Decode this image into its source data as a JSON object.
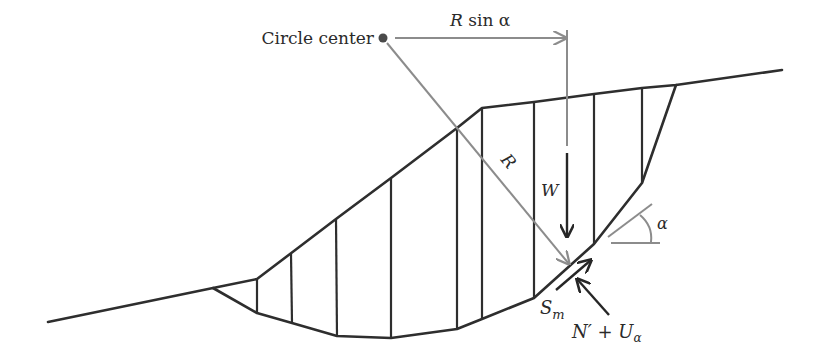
{
  "figure": {
    "labels": {
      "circle_center": "Circle center",
      "r_sin_alpha_R": "R",
      "r_sin_alpha_rest": " sin α",
      "radius": "R",
      "weight": "W",
      "alpha": "α",
      "shear_S": "S",
      "shear_sub": "m",
      "normal_N": "N′ + U",
      "normal_sub": "α"
    },
    "colors": {
      "line": "#2e2e2e",
      "construction": "#8c8c8c",
      "background": "#ffffff"
    },
    "geometry": {
      "circle_center": [
        383,
        38
      ],
      "ground_surface": [
        [
          48,
          322
        ],
        [
          213,
          288
        ],
        [
          257,
          279
        ],
        [
          290,
          254
        ],
        [
          336,
          219
        ],
        [
          391,
          178
        ],
        [
          457,
          128
        ],
        [
          482,
          108
        ],
        [
          534,
          102
        ],
        [
          594,
          94
        ],
        [
          642,
          88
        ],
        [
          676,
          85
        ],
        [
          782,
          70
        ]
      ],
      "slip_surface": [
        [
          213,
          288
        ],
        [
          257,
          313
        ],
        [
          292,
          323
        ],
        [
          337,
          336
        ],
        [
          391,
          338
        ],
        [
          457,
          329
        ],
        [
          482,
          319
        ],
        [
          534,
          298
        ],
        [
          594,
          244
        ],
        [
          642,
          183
        ],
        [
          676,
          85
        ]
      ],
      "slice_count": 10
    }
  }
}
